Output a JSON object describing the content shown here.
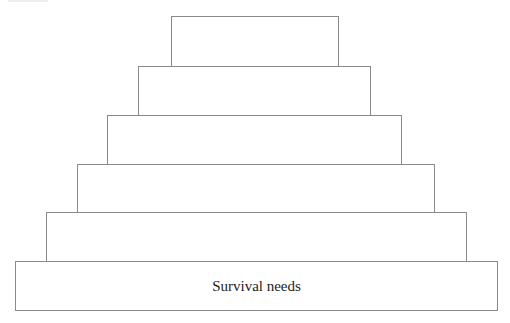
{
  "diagram": {
    "type": "pyramid",
    "levels": [
      {
        "label": "",
        "x": 171,
        "y": 16,
        "w": 168,
        "h": 51
      },
      {
        "label": "",
        "x": 138,
        "y": 66,
        "w": 233,
        "h": 50
      },
      {
        "label": "",
        "x": 107,
        "y": 115,
        "w": 295,
        "h": 50
      },
      {
        "label": "",
        "x": 77,
        "y": 164,
        "w": 358,
        "h": 49
      },
      {
        "label": "",
        "x": 46,
        "y": 212,
        "w": 421,
        "h": 50
      },
      {
        "label": "Survival needs",
        "x": 15,
        "y": 261,
        "w": 483,
        "h": 50
      }
    ],
    "line_color": "#8a8a8a"
  }
}
